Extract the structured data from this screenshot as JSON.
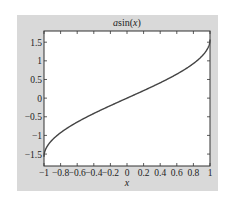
{
  "chart_data": {
    "type": "line",
    "title": "asin(x)",
    "title_parts": {
      "plain": "a",
      "func": "sin",
      "open": "(",
      "var": "x",
      "close": ")"
    },
    "xlabel": "x",
    "ylabel": "",
    "xlim": [
      -1,
      1
    ],
    "ylim": [
      -1.82,
      1.8
    ],
    "grid": false,
    "legend": null,
    "xticks": [
      -1,
      -0.8,
      -0.6,
      -0.4,
      -0.2,
      0,
      0.2,
      0.4,
      0.6,
      0.8,
      1
    ],
    "xtick_labels": [
      "−1",
      "−0.8",
      "−0.6",
      "−0.4",
      "−0.2",
      "0",
      "0.2",
      "0.4",
      "0.6",
      "0.8",
      "1"
    ],
    "yticks": [
      -1.5,
      -1,
      -0.5,
      0,
      0.5,
      1,
      1.5
    ],
    "ytick_labels": [
      "−1.5",
      "−1",
      "−0.5",
      "0",
      "0.5",
      "1",
      "1.5"
    ],
    "series": [
      {
        "name": "asin(x)",
        "function": "asin",
        "color": "#444444",
        "x": [
          -1,
          -0.98,
          -0.95,
          -0.9,
          -0.8,
          -0.7,
          -0.6,
          -0.5,
          -0.4,
          -0.3,
          -0.2,
          -0.1,
          0,
          0.1,
          0.2,
          0.3,
          0.4,
          0.5,
          0.6,
          0.7,
          0.8,
          0.9,
          0.95,
          0.98,
          1
        ],
        "y": [
          -1.5708,
          -1.3705,
          -1.2532,
          -1.1198,
          -0.9273,
          -0.7754,
          -0.6435,
          -0.5236,
          -0.4115,
          -0.3047,
          -0.2014,
          -0.1002,
          0,
          0.1002,
          0.2014,
          0.3047,
          0.4115,
          0.5236,
          0.6435,
          0.7754,
          0.9273,
          1.1198,
          1.2532,
          1.3705,
          1.5708
        ]
      }
    ]
  },
  "colors": {
    "figure_bg": "#d9d9d9",
    "axes_bg": "#ffffff",
    "axes_edge": "#333333",
    "line": "#444444"
  }
}
